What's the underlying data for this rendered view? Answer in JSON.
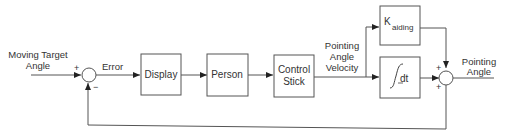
{
  "diagram": {
    "type": "block-diagram",
    "inputs": [
      {
        "id": "input",
        "label_line1": "Moving Target",
        "label_line2": "Angle"
      }
    ],
    "signals": {
      "error": "Error",
      "velocity_line1": "Pointing",
      "velocity_line2": "Angle",
      "velocity_line3": "Velocity",
      "output_line1": "Pointing",
      "output_line2": "Angle"
    },
    "blocks": [
      {
        "id": "display",
        "label": "Display"
      },
      {
        "id": "person",
        "label": "Person"
      },
      {
        "id": "control-stick",
        "label_line1": "Control",
        "label_line2": "Stick"
      },
      {
        "id": "k-aiding",
        "label_main": "K",
        "label_sub": "aiding"
      },
      {
        "id": "integrator",
        "label": "dt"
      }
    ],
    "summing_junctions": [
      {
        "id": "sum1",
        "signs": {
          "left": "+",
          "bottom": "−"
        }
      },
      {
        "id": "sum2",
        "signs": {
          "top": "+",
          "left": "+"
        }
      }
    ],
    "edges": [
      [
        "input",
        "sum1"
      ],
      [
        "sum1",
        "display"
      ],
      [
        "display",
        "person"
      ],
      [
        "person",
        "control-stick"
      ],
      [
        "control-stick",
        "k-aiding"
      ],
      [
        "control-stick",
        "integrator"
      ],
      [
        "k-aiding",
        "sum2"
      ],
      [
        "integrator",
        "sum2"
      ],
      [
        "sum2",
        "output"
      ],
      [
        "output",
        "sum1",
        "feedback"
      ]
    ]
  }
}
